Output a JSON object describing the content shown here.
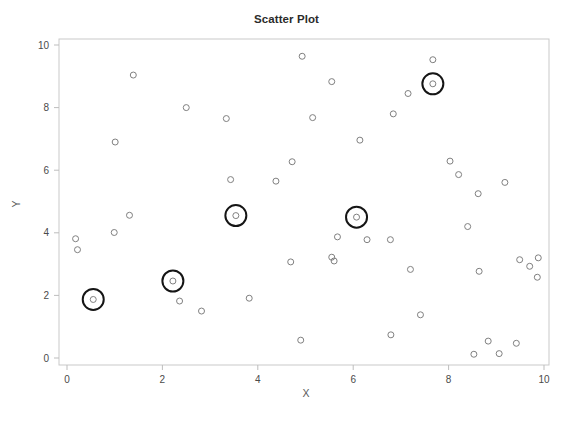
{
  "chart_data": {
    "type": "scatter",
    "title": "Scatter Plot",
    "xlabel": "X",
    "ylabel": "Y",
    "xlim": [
      0,
      10
    ],
    "ylim": [
      0,
      10
    ],
    "xticks": [
      0,
      2,
      4,
      6,
      8,
      10
    ],
    "yticks": [
      0,
      2,
      4,
      6,
      8,
      10
    ],
    "xtick_labels": [
      "0",
      "2",
      "4",
      "6",
      "8",
      "10"
    ],
    "ytick_labels": [
      "0",
      "2",
      "4",
      "6",
      "8",
      "10"
    ],
    "grid": false,
    "legend": "none",
    "marker": "open-circle",
    "marker_color": "#808080",
    "highlight_color": "#151515",
    "points": [
      {
        "x": 0.18,
        "y": 3.81,
        "highlighted": false
      },
      {
        "x": 0.22,
        "y": 3.46,
        "highlighted": false
      },
      {
        "x": 0.55,
        "y": 1.87,
        "highlighted": true
      },
      {
        "x": 0.99,
        "y": 4.01,
        "highlighted": false
      },
      {
        "x": 1.01,
        "y": 6.9,
        "highlighted": false
      },
      {
        "x": 1.31,
        "y": 4.56,
        "highlighted": false
      },
      {
        "x": 1.39,
        "y": 9.04,
        "highlighted": false
      },
      {
        "x": 2.22,
        "y": 2.46,
        "highlighted": true
      },
      {
        "x": 2.36,
        "y": 1.82,
        "highlighted": false
      },
      {
        "x": 2.5,
        "y": 8.0,
        "highlighted": false
      },
      {
        "x": 2.82,
        "y": 1.5,
        "highlighted": false
      },
      {
        "x": 3.34,
        "y": 7.65,
        "highlighted": false
      },
      {
        "x": 3.43,
        "y": 5.7,
        "highlighted": false
      },
      {
        "x": 3.54,
        "y": 4.55,
        "highlighted": true
      },
      {
        "x": 3.82,
        "y": 1.91,
        "highlighted": false
      },
      {
        "x": 4.38,
        "y": 5.65,
        "highlighted": false
      },
      {
        "x": 4.69,
        "y": 3.07,
        "highlighted": false
      },
      {
        "x": 4.72,
        "y": 6.27,
        "highlighted": false
      },
      {
        "x": 4.9,
        "y": 0.57,
        "highlighted": false
      },
      {
        "x": 4.93,
        "y": 9.64,
        "highlighted": false
      },
      {
        "x": 5.15,
        "y": 7.68,
        "highlighted": false
      },
      {
        "x": 5.55,
        "y": 8.83,
        "highlighted": false
      },
      {
        "x": 5.55,
        "y": 3.22,
        "highlighted": false
      },
      {
        "x": 5.6,
        "y": 3.1,
        "highlighted": false
      },
      {
        "x": 5.67,
        "y": 3.87,
        "highlighted": false
      },
      {
        "x": 6.07,
        "y": 4.5,
        "highlighted": true
      },
      {
        "x": 6.14,
        "y": 6.96,
        "highlighted": false
      },
      {
        "x": 6.29,
        "y": 3.78,
        "highlighted": false
      },
      {
        "x": 6.78,
        "y": 3.78,
        "highlighted": false
      },
      {
        "x": 6.79,
        "y": 0.74,
        "highlighted": false
      },
      {
        "x": 6.84,
        "y": 7.8,
        "highlighted": false
      },
      {
        "x": 7.15,
        "y": 8.45,
        "highlighted": false
      },
      {
        "x": 7.2,
        "y": 2.83,
        "highlighted": false
      },
      {
        "x": 7.41,
        "y": 1.38,
        "highlighted": false
      },
      {
        "x": 7.67,
        "y": 8.76,
        "highlighted": true
      },
      {
        "x": 7.67,
        "y": 9.53,
        "highlighted": false
      },
      {
        "x": 8.03,
        "y": 6.29,
        "highlighted": false
      },
      {
        "x": 8.21,
        "y": 5.86,
        "highlighted": false
      },
      {
        "x": 8.4,
        "y": 4.2,
        "highlighted": false
      },
      {
        "x": 8.53,
        "y": 0.12,
        "highlighted": false
      },
      {
        "x": 8.62,
        "y": 5.25,
        "highlighted": false
      },
      {
        "x": 8.64,
        "y": 2.77,
        "highlighted": false
      },
      {
        "x": 8.83,
        "y": 0.54,
        "highlighted": false
      },
      {
        "x": 9.06,
        "y": 0.14,
        "highlighted": false
      },
      {
        "x": 9.18,
        "y": 5.61,
        "highlighted": false
      },
      {
        "x": 9.42,
        "y": 0.47,
        "highlighted": false
      },
      {
        "x": 9.49,
        "y": 3.14,
        "highlighted": false
      },
      {
        "x": 9.7,
        "y": 2.93,
        "highlighted": false
      },
      {
        "x": 9.86,
        "y": 2.58,
        "highlighted": false
      },
      {
        "x": 9.88,
        "y": 3.2,
        "highlighted": false
      }
    ]
  }
}
